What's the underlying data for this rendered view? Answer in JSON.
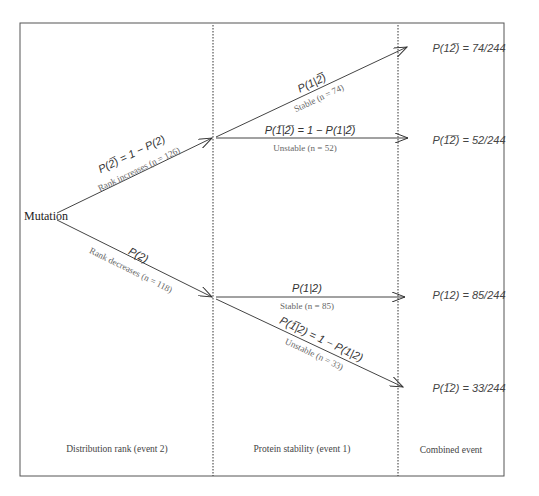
{
  "figure": {
    "root_label": "Mutation",
    "columns": [
      {
        "label": "Distribution rank (event 2)"
      },
      {
        "label": "Protein stability  (event 1)"
      },
      {
        "label": "Combined event"
      }
    ],
    "stage1_branches": [
      {
        "prob": "P(2̅) = 1 − P(2)",
        "desc": "Rank increases (n = 126)"
      },
      {
        "prob": "P(2)",
        "desc": "Rank decreases (n = 118)"
      }
    ],
    "stage2_branches": [
      {
        "prob": "P(1|2̅)",
        "desc": "Stable (n = 74)"
      },
      {
        "prob": "P(1̅|2̅) = 1 − P(1|2̅)",
        "desc": "Unstable (n = 52)"
      },
      {
        "prob": "P(1|2)",
        "desc": "Stable (n = 85)"
      },
      {
        "prob": "P(1̅|2) = 1 − P(1|2)",
        "desc": "Unstable (n = 33)"
      }
    ],
    "outcomes": [
      {
        "label": "P(12̅) = 74/244"
      },
      {
        "label": "P(1̅2̅) = 52/244"
      },
      {
        "label": "P(12) = 85/244"
      },
      {
        "label": "P(1̅2) = 33/244"
      }
    ],
    "colors": {
      "line": "#444444",
      "frame": "#555555",
      "divider": "#333333"
    }
  }
}
